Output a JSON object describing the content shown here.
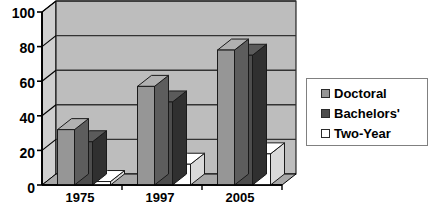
{
  "chart_data": {
    "type": "bar",
    "title": "",
    "subtitle": "",
    "xlabel": "",
    "ylabel": "",
    "categories": [
      "1975",
      "1997",
      "2005"
    ],
    "series": [
      {
        "name": "Doctoral",
        "color": "#969696",
        "values": [
          32,
          57,
          78
        ]
      },
      {
        "name": "Bachelors'",
        "color": "#4d4d4d",
        "values": [
          25,
          48,
          75
        ]
      },
      {
        "name": "Two-Year",
        "color": "#ffffff",
        "values": [
          2,
          12,
          18
        ]
      }
    ],
    "ylim": [
      0,
      100
    ],
    "yticks": [
      0,
      20,
      40,
      60,
      80,
      100
    ],
    "ytick_labels": [
      "0",
      "20",
      "40",
      "60",
      "80",
      "100"
    ],
    "grid": true,
    "grid_axis": "y",
    "legend_position": "right",
    "style": "3d-column",
    "plot_background": "#bdbdbd",
    "grid_color": "#333333",
    "axis_color": "#000000"
  },
  "legend": {
    "items": [
      {
        "label": "Doctoral",
        "color": "#969696"
      },
      {
        "label": "Bachelors'",
        "color": "#4d4d4d"
      },
      {
        "label": "Two-Year",
        "color": "#ffffff"
      }
    ]
  },
  "axes": {
    "y_tick_labels": [
      "100",
      "80",
      "60",
      "40",
      "20",
      "0"
    ],
    "x_tick_labels": [
      "1975",
      "1997",
      "2005"
    ]
  }
}
